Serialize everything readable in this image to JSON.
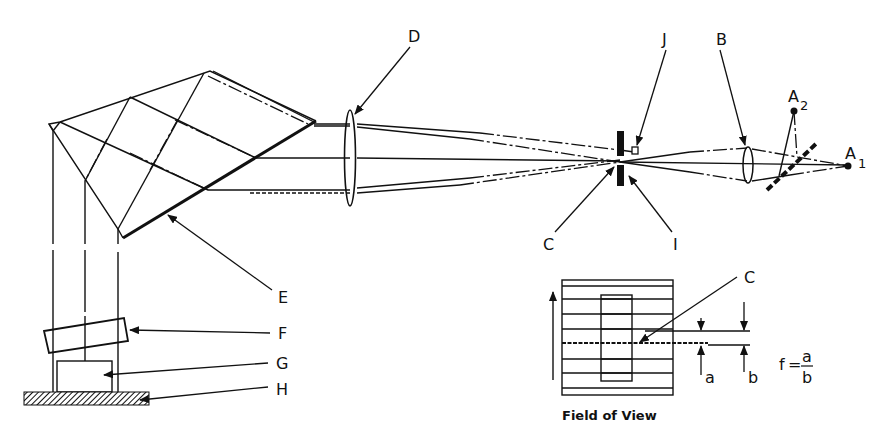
{
  "diagram": {
    "type": "optical-schematic",
    "labels": {
      "A1": {
        "main": "A",
        "sub": "1"
      },
      "A2": {
        "main": "A",
        "sub": "2"
      },
      "B": "B",
      "C_top": "C",
      "C_inset": "C",
      "D": "D",
      "E": "E",
      "F": "F",
      "G": "G",
      "H": "H",
      "I": "I",
      "J": "J",
      "a": "a",
      "b": "b"
    },
    "formula": {
      "lhs": "f",
      "equals": "=",
      "numerator": "a",
      "denominator": "b"
    },
    "inset_caption": "Field of View",
    "components": [
      {
        "id": "A1",
        "kind": "light-source-point"
      },
      {
        "id": "A2",
        "kind": "light-source-point"
      },
      {
        "id": "B",
        "kind": "condenser-lens"
      },
      {
        "id": "C",
        "kind": "slit-image-line"
      },
      {
        "id": "D",
        "kind": "objective-lens"
      },
      {
        "id": "E",
        "kind": "prism-reflecting-face"
      },
      {
        "id": "F",
        "kind": "tilted-plate"
      },
      {
        "id": "G",
        "kind": "specimen-block"
      },
      {
        "id": "H",
        "kind": "base-surface"
      },
      {
        "id": "I",
        "kind": "slit-diaphragm"
      },
      {
        "id": "J",
        "kind": "small-aperture"
      }
    ],
    "colors": {
      "ink": "#111111",
      "background": "#ffffff"
    }
  }
}
